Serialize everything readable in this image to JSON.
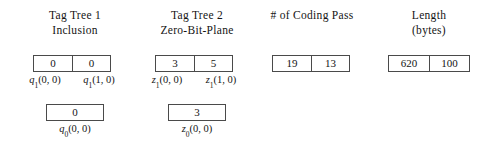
{
  "figure": {
    "columns": [
      {
        "id": "tag-tree-1",
        "header_line1": "Tag Tree 1",
        "header_line2": "Inclusion",
        "level1": {
          "values": [
            "0",
            "0"
          ],
          "labels": [
            {
              "var": "q",
              "sub": "1",
              "args": "(0, 0)"
            },
            {
              "var": "q",
              "sub": "1",
              "args": "(1, 0)"
            }
          ]
        },
        "level0": {
          "values": [
            "0"
          ],
          "labels": [
            {
              "var": "q",
              "sub": "0",
              "args": "(0, 0)"
            }
          ]
        }
      },
      {
        "id": "tag-tree-2",
        "header_line1": "Tag Tree 2",
        "header_line2": "Zero-Bit-Plane",
        "level1": {
          "values": [
            "3",
            "5"
          ],
          "labels": [
            {
              "var": "z",
              "sub": "1",
              "args": "(0, 0)"
            },
            {
              "var": "z",
              "sub": "1",
              "args": "(1, 0)"
            }
          ]
        },
        "level0": {
          "values": [
            "3"
          ],
          "labels": [
            {
              "var": "z",
              "sub": "0",
              "args": "(0, 0)"
            }
          ]
        }
      },
      {
        "id": "coding-pass",
        "header_line1": "# of Coding Pass",
        "header_line2": "",
        "level1": {
          "values": [
            "19",
            "13"
          ],
          "labels": []
        },
        "level0": null
      },
      {
        "id": "length",
        "header_line1": "Length",
        "header_line2": "(bytes)",
        "level1": {
          "values": [
            "620",
            "100"
          ],
          "labels": []
        },
        "level0": null
      }
    ]
  }
}
